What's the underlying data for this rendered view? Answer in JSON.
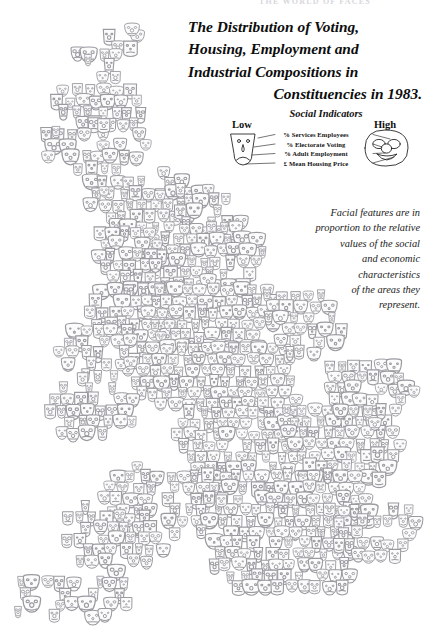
{
  "running_head": "THE WORLD OF FACES",
  "title": {
    "line1": "The Distribution of Voting,",
    "line2": "Housing, Employment and",
    "line3": "Industrial Compositions in",
    "line4": "Constituencies in 1983."
  },
  "legend": {
    "heading": "Social Indicators",
    "low_label": "Low",
    "high_label": "High",
    "items": [
      "% Services Employees",
      "% Electorate Voting",
      "% Adult Employment",
      "£ Mean Housing Price"
    ]
  },
  "caption": {
    "line1": "Facial features are in",
    "line2": "proportion to the relative",
    "line3": "values of the social",
    "line4": "and economic",
    "line5": "characteristics",
    "line6": "of the areas they",
    "line7": "represent."
  },
  "colors": {
    "background": "#ffffff",
    "face_stroke": "#9a9aa0",
    "face_fill": "#fbfbfc",
    "text": "#111111",
    "legend_stroke": "#1a1a1a",
    "running_head": "#d8d8dc"
  },
  "chart_data": {
    "type": "scatter",
    "title": "The Distribution of Voting, Housing, Employment and Industrial Compositions in Constituencies in 1983.",
    "subtitle": "Chernoff-face cartogram of UK parliamentary constituencies",
    "xlabel": "",
    "ylabel": "",
    "glyph": "chernoff-face",
    "encoded_variables": [
      {
        "feature": "face width",
        "indicator": "% Services Employees",
        "low": "narrow",
        "high": "wide"
      },
      {
        "feature": "eye size",
        "indicator": "% Electorate Voting",
        "low": "small",
        "high": "large"
      },
      {
        "feature": "nose size",
        "indicator": "% Adult Employment",
        "low": "small",
        "high": "large"
      },
      {
        "feature": "mouth curve",
        "indicator": "£ Mean Housing Price",
        "low": "frown",
        "high": "smile"
      }
    ],
    "legend_position": "top-right",
    "grid": false,
    "marker_count": 633,
    "region": "Great Britain constituencies, 1983"
  }
}
